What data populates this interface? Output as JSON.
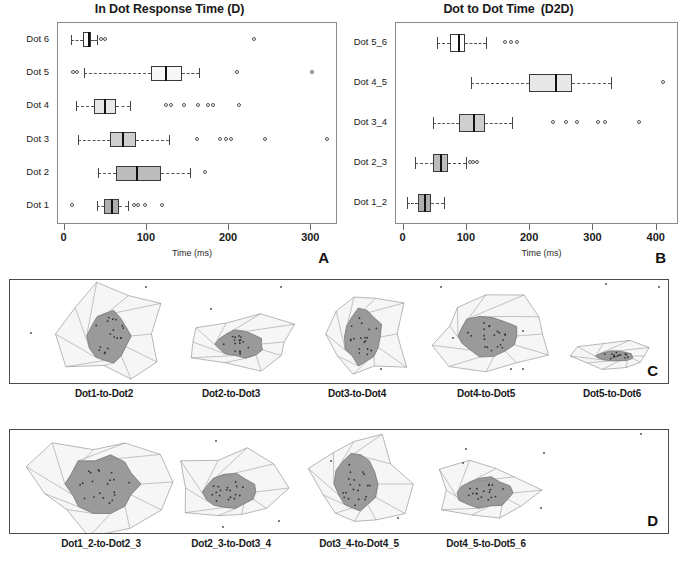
{
  "figure": {
    "panels": [
      "A",
      "B",
      "C",
      "D"
    ]
  },
  "panelA": {
    "letter": "A",
    "title": "In Dot Response Time (D)",
    "title_sub": "",
    "xlabel": "Time (ms)",
    "xticks": [
      0,
      100,
      200,
      300
    ],
    "xlim": [
      -8,
      330
    ],
    "ylabels": [
      "Dot 6",
      "Dot 5",
      "Dot 4",
      "Dot 3",
      "Dot 2",
      "Dot 1"
    ]
  },
  "panelB": {
    "letter": "B",
    "title": "Dot to Dot Time",
    "title_sub": "(D2D)",
    "xlabel": "Time (ms)",
    "xticks": [
      0,
      100,
      200,
      300,
      400
    ],
    "xlim": [
      -12,
      432
    ],
    "ylabels": [
      "Dot 5_6",
      "Dot 4_5",
      "Dot 3_4",
      "Dot 2_3",
      "Dot 1_2"
    ]
  },
  "panelC": {
    "letter": "C",
    "labels": [
      "Dot1-to-Dot2",
      "Dot2-to-Dot3",
      "Dot3-to-Dot4",
      "Dot4-to-Dot5",
      "Dot5-to-Dot6"
    ]
  },
  "panelD": {
    "letter": "D",
    "labels": [
      "Dot1_2-to-Dot2_3",
      "Dot2_3-to-Dot3_4",
      "Dot3_4-to-Dot4_5",
      "Dot4_5-to-Dot5_6"
    ]
  },
  "colors": {
    "box_fills": [
      "#ffffff",
      "#f7f7f7",
      "#e8e8e8",
      "#cfcfcf",
      "#bcbcbc",
      "#aeaeae"
    ],
    "hull_fill": "#f4f4f4",
    "core_fill": "#9a9a9a",
    "outline": "#3a3a3a",
    "frame": "#4a4a4a"
  },
  "chart_data": [
    {
      "type": "box",
      "panel": "A",
      "title": "In Dot Response Time (D)",
      "xlabel": "Time (ms)",
      "ylabel": "",
      "xlim": [
        -8,
        330
      ],
      "xticks": [
        0,
        100,
        200,
        300
      ],
      "grid": false,
      "orientation": "horizontal",
      "categories": [
        "Dot 6",
        "Dot 5",
        "Dot 4",
        "Dot 3",
        "Dot 2",
        "Dot 1"
      ],
      "boxes": [
        {
          "category": "Dot 6",
          "whisker_low": 8,
          "q1": 22,
          "median": 28,
          "q3": 32,
          "whisker_high": 40,
          "fill": "#ffffff",
          "outliers": [
            46,
            50,
            232
          ]
        },
        {
          "category": "Dot 5",
          "whisker_low": 24,
          "q1": 105,
          "median": 122,
          "q3": 143,
          "whisker_high": 164,
          "fill": "#f7f7f7",
          "outliers": [
            12,
            16,
            211,
            302
          ]
        },
        {
          "category": "Dot 4",
          "whisker_low": 14,
          "q1": 36,
          "median": 48,
          "q3": 62,
          "whisker_high": 79,
          "fill": "#e8e8e8",
          "outliers": [
            124,
            131,
            146,
            163,
            176,
            182,
            213
          ]
        },
        {
          "category": "Dot 3",
          "whisker_low": 16,
          "q1": 55,
          "median": 70,
          "q3": 87,
          "whisker_high": 127,
          "fill": "#cfcfcf",
          "outliers": [
            162,
            190,
            197,
            204,
            245,
            320
          ]
        },
        {
          "category": "Dot 2",
          "whisker_low": 41,
          "q1": 62,
          "median": 87,
          "q3": 117,
          "whisker_high": 152,
          "fill": "#bcbcbc",
          "outliers": [
            172
          ]
        },
        {
          "category": "Dot 1",
          "whisker_low": 40,
          "q1": 48,
          "median": 56,
          "q3": 66,
          "whisker_high": 77,
          "fill": "#aeaeae",
          "outliers": [
            10,
            86,
            90,
            99,
            120
          ]
        }
      ]
    },
    {
      "type": "box",
      "panel": "B",
      "title": "Dot to Dot Time (D2D)",
      "xlabel": "Time (ms)",
      "ylabel": "",
      "xlim": [
        -12,
        432
      ],
      "xticks": [
        0,
        100,
        200,
        300,
        400
      ],
      "grid": false,
      "orientation": "horizontal",
      "categories": [
        "Dot 5_6",
        "Dot 4_5",
        "Dot 3_4",
        "Dot 2_3",
        "Dot 1_2"
      ],
      "boxes": [
        {
          "category": "Dot 5_6",
          "whisker_low": 52,
          "q1": 73,
          "median": 86,
          "q3": 97,
          "whisker_high": 130,
          "fill": "#ffffff",
          "outliers": [
            162,
            172,
            181
          ]
        },
        {
          "category": "Dot 4_5",
          "whisker_low": 106,
          "q1": 198,
          "median": 240,
          "q3": 266,
          "whisker_high": 327,
          "fill": "#e8e8e8",
          "outliers": [
            412
          ]
        },
        {
          "category": "Dot 3_4",
          "whisker_low": 46,
          "q1": 88,
          "median": 110,
          "q3": 129,
          "whisker_high": 172,
          "fill": "#cfcfcf",
          "outliers": [
            237,
            258,
            275,
            309,
            320,
            373
          ]
        },
        {
          "category": "Dot 2_3",
          "whisker_low": 18,
          "q1": 47,
          "median": 58,
          "q3": 70,
          "whisker_high": 98,
          "fill": "#bcbcbc",
          "outliers": [
            106,
            112,
            118
          ]
        },
        {
          "category": "Dot 1_2",
          "whisker_low": 6,
          "q1": 22,
          "median": 33,
          "q3": 44,
          "whisker_high": 64,
          "fill": "#aeaeae",
          "outliers": []
        }
      ]
    }
  ]
}
